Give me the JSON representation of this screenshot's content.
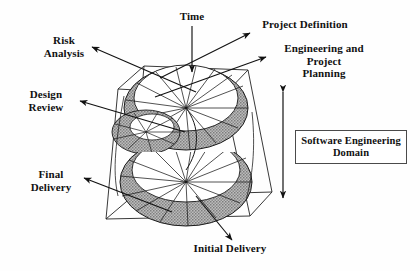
{
  "figure": {
    "background_color": "#fefefe",
    "ink_color": "#111111",
    "spiral_fill_color": "#a8a8a8"
  },
  "labels": {
    "time": "Time",
    "risk_analysis": "Risk\nAnalysis",
    "design_review": "Design\nReview",
    "final_delivery": "Final\nDelivery",
    "project_definition": "Project Definition",
    "engineering_planning": "Engineering and Project\nPlanning",
    "initial_delivery": "Initial Delivery",
    "software_engineering_domain": "Software Engineering\nDomain"
  },
  "icons": {
    "time_arrow": "arrow-down-icon",
    "risk_arrow": "arrow-left-icon",
    "design_arrow": "arrow-left-icon",
    "final_arrow": "arrow-left-icon",
    "definition_arrow": "arrow-up-right-icon",
    "engineering_arrow": "arrow-up-right-icon",
    "initial_arrow": "arrow-down-right-icon",
    "domain_extent_arrow": "double-headed-vertical-arrow-icon",
    "spiral": "helix-spiral-icon",
    "box": "wireframe-cube-icon"
  }
}
